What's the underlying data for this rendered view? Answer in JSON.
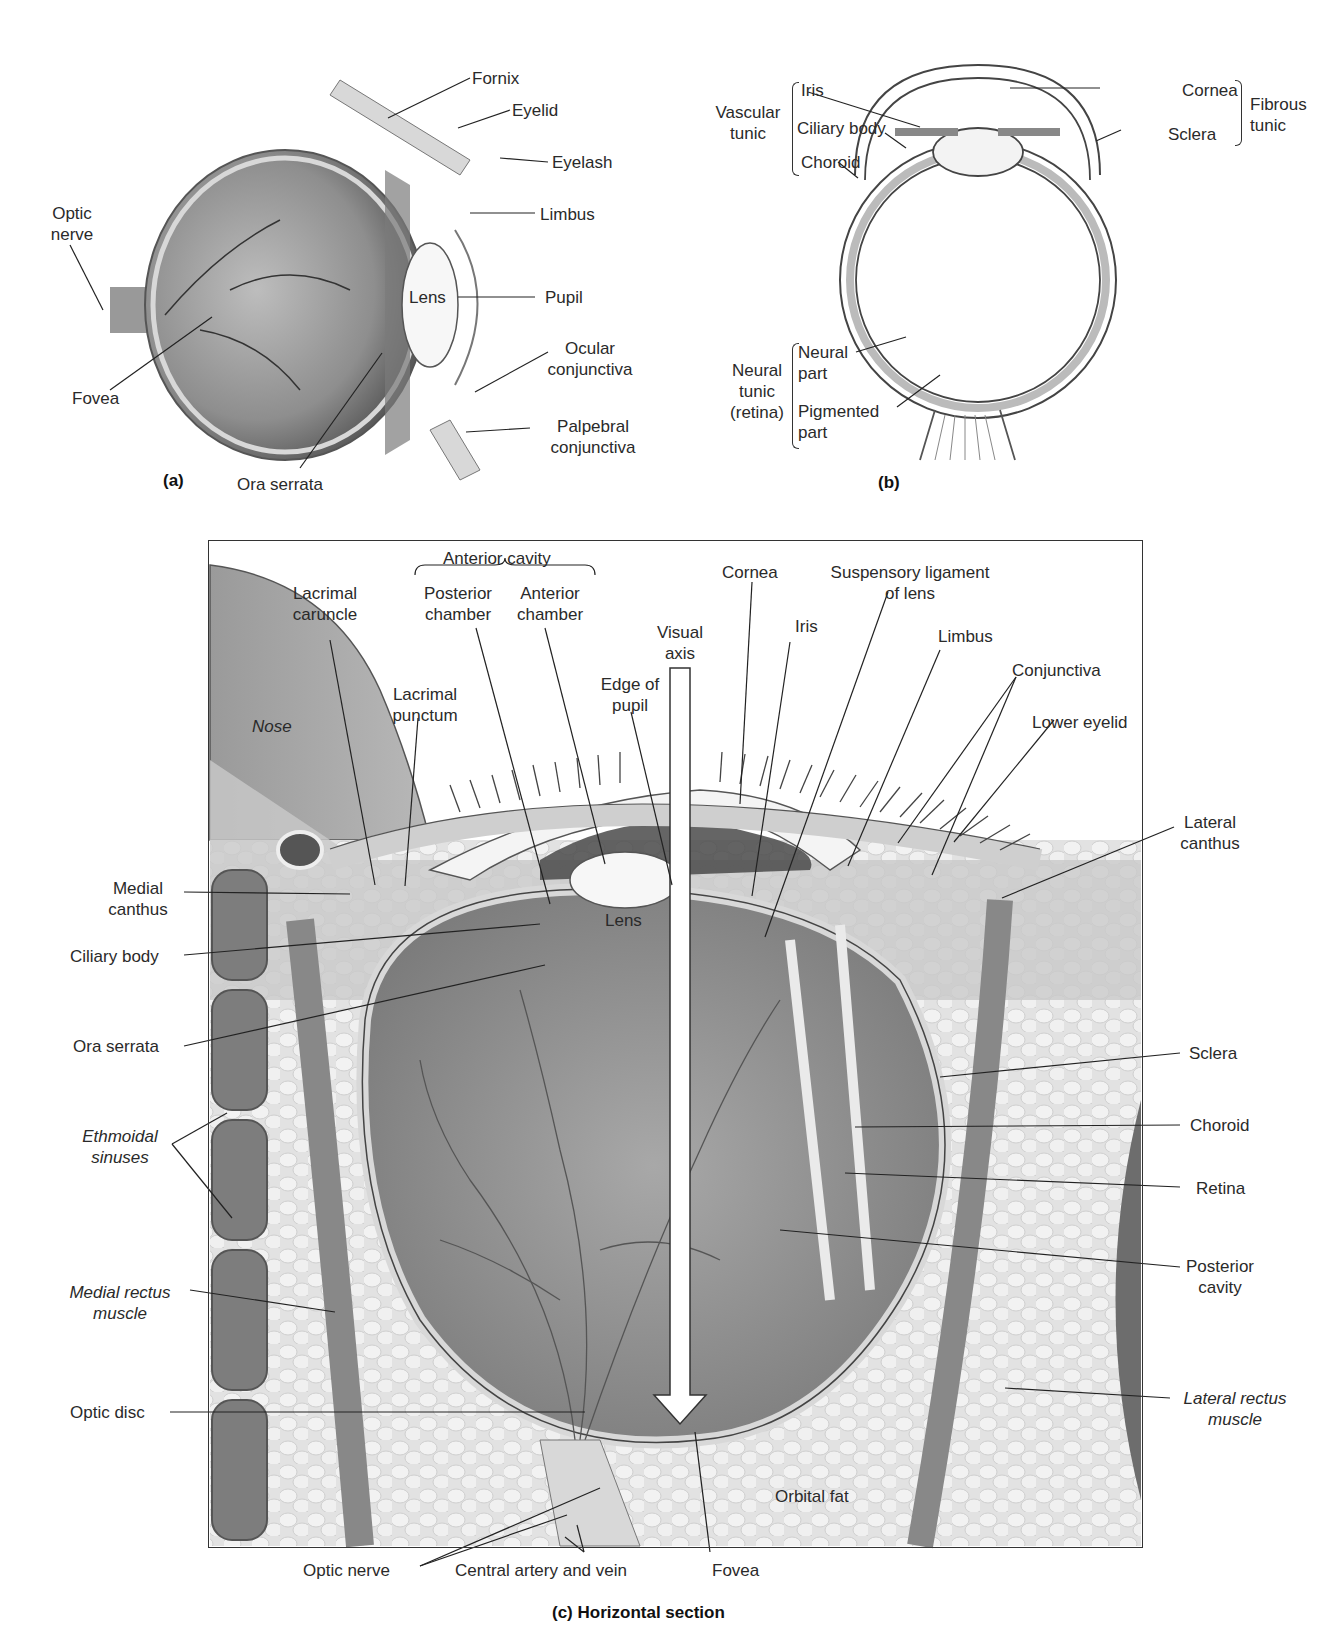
{
  "panel_a": {
    "caption": "(a)",
    "labels": {
      "fornix": "Fornix",
      "eyelid": "Eyelid",
      "eyelash": "Eyelash",
      "limbus": "Limbus",
      "optic_nerve_1": "Optic",
      "optic_nerve_2": "nerve",
      "lens": "Lens",
      "pupil": "Pupil",
      "ocular_conj_1": "Ocular",
      "ocular_conj_2": "conjunctiva",
      "fovea": "Fovea",
      "palpebral_conj_1": "Palpebral",
      "palpebral_conj_2": "conjunctiva",
      "ora_serrata": "Ora serrata"
    }
  },
  "panel_b": {
    "caption": "(b)",
    "labels": {
      "vascular_tunic_1": "Vascular",
      "vascular_tunic_2": "tunic",
      "iris": "Iris",
      "ciliary_body": "Ciliary body",
      "choroid": "Choroid",
      "cornea": "Cornea",
      "sclera": "Sclera",
      "fibrous_tunic_1": "Fibrous",
      "fibrous_tunic_2": "tunic",
      "neural_tunic_1": "Neural",
      "neural_tunic_2": "tunic",
      "neural_tunic_3": "(retina)",
      "neural_part_1": "Neural",
      "neural_part_2": "part",
      "pigmented_part_1": "Pigmented",
      "pigmented_part_2": "part"
    }
  },
  "panel_c": {
    "caption": "(c) Horizontal section",
    "labels": {
      "anterior_cavity": "Anterior cavity",
      "posterior_chamber_1": "Posterior",
      "posterior_chamber_2": "chamber",
      "anterior_chamber_1": "Anterior",
      "anterior_chamber_2": "chamber",
      "lacrimal_caruncle_1": "Lacrimal",
      "lacrimal_caruncle_2": "caruncle",
      "lacrimal_punctum_1": "Lacrimal",
      "lacrimal_punctum_2": "punctum",
      "nose": "Nose",
      "cornea": "Cornea",
      "suspensory_1": "Suspensory ligament",
      "suspensory_2": "of lens",
      "visual_axis_1": "Visual",
      "visual_axis_2": "axis",
      "iris": "Iris",
      "limbus": "Limbus",
      "edge_pupil_1": "Edge of",
      "edge_pupil_2": "pupil",
      "conjunctiva": "Conjunctiva",
      "lower_eyelid": "Lower eyelid",
      "lateral_canthus_1": "Lateral",
      "lateral_canthus_2": "canthus",
      "medial_canthus_1": "Medial",
      "medial_canthus_2": "canthus",
      "lens": "Lens",
      "ciliary_body": "Ciliary body",
      "ora_serrata": "Ora serrata",
      "sclera": "Sclera",
      "choroid": "Choroid",
      "retina": "Retina",
      "ethmoidal_1": "Ethmoidal",
      "ethmoidal_2": "sinuses",
      "posterior_cavity_1": "Posterior",
      "posterior_cavity_2": "cavity",
      "medial_rectus_1": "Medial rectus",
      "medial_rectus_2": "muscle",
      "lateral_rectus_1": "Lateral rectus",
      "lateral_rectus_2": "muscle",
      "optic_disc": "Optic disc",
      "orbital_fat": "Orbital fat",
      "optic_nerve": "Optic nerve",
      "central_artery_vein": "Central artery and vein",
      "fovea": "Fovea"
    }
  },
  "colors": {
    "tissue_dark": "#6e6e6e",
    "tissue_mid": "#9a9a9a",
    "tissue_light": "#cfcfcf",
    "tissue_pale": "#e8e8e8",
    "line": "#2a2a2a"
  }
}
